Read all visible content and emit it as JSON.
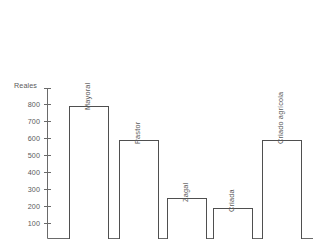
{
  "chart_data": {
    "type": "bar",
    "title": "",
    "subtitle": "",
    "xlabel": "",
    "ylabel": "Reales",
    "categories": [
      "Mayoral",
      "Pastor",
      "Zagal",
      "Criada",
      "Criado agrícola"
    ],
    "values": [
      790,
      590,
      240,
      180,
      590
    ],
    "ylim": [
      0,
      850
    ],
    "yticks": [
      100,
      200,
      300,
      400,
      500,
      600,
      700,
      800
    ],
    "ytick_labels": [
      "100",
      "200",
      "300",
      "400",
      "500",
      "600",
      "700",
      "800"
    ],
    "grid": false,
    "legend": null,
    "legend_position": "none",
    "series": [
      {
        "name": "Reales",
        "values": [
          790,
          590,
          240,
          180,
          590
        ]
      }
    ],
    "annotations": [],
    "colors": {
      "bar_fill": "#ffffff",
      "bar_edge": "#4f4f4f",
      "axis": "#6a6a6a",
      "text": "#5a5a5a",
      "background": "#ffffff"
    }
  }
}
